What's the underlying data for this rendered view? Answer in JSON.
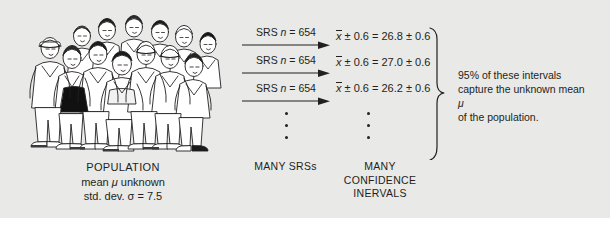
{
  "figure": {
    "background_color": "#e9e9e7",
    "text_color": "#231f20"
  },
  "population": {
    "title": "POPULATION",
    "mean_line_prefix": "mean ",
    "mean_symbol": "μ",
    "mean_line_suffix": " unknown",
    "sd_line_prefix": "std. dev. ",
    "sd_symbol": "σ",
    "sd_line_suffix": " = 7.5",
    "illustration_alt": "crowd-of-people-line-drawing"
  },
  "srs": {
    "arrows": [
      {
        "prefix": "SRS ",
        "variable": "n",
        "value": " = 654"
      },
      {
        "prefix": "SRS ",
        "variable": "n",
        "value": " = 654"
      },
      {
        "prefix": "SRS ",
        "variable": "n",
        "value": " = 654"
      }
    ],
    "vertical_dots_count": 3,
    "caption": "MANY SRSs"
  },
  "intervals": {
    "rows": [
      {
        "statistic": "x",
        "margin": " ± 0.6 = ",
        "estimate": "26.8",
        "pm": " ± 0.6"
      },
      {
        "statistic": "x",
        "margin": " ± 0.6 = ",
        "estimate": "27.0",
        "pm": " ± 0.6"
      },
      {
        "statistic": "x",
        "margin": " ± 0.6 = ",
        "estimate": "26.2",
        "pm": " ± 0.6"
      }
    ],
    "vertical_dots_count": 3,
    "caption_line1": "MANY CONFIDENCE",
    "caption_line2": "INERVALS"
  },
  "note": {
    "line1": "95% of these intervals",
    "line2": "capture the unknown mean",
    "line3_symbol": "μ",
    "line3_rest": " of the population."
  }
}
